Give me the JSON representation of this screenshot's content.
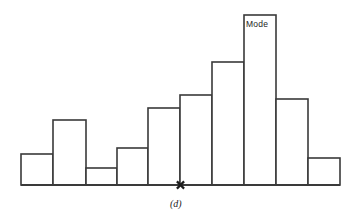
{
  "figure": {
    "caption": "(d)",
    "caption_x": 170,
    "caption_y": 199,
    "background_color": "#ffffff",
    "line_color": "#3a3a3a",
    "width": 358,
    "height": 217
  },
  "annotations": {
    "mode_label": "Mode",
    "mode_label_x": 246,
    "mode_label_y": 20,
    "x_marker_symbol": "x",
    "x_marker_position": 180.5
  },
  "chart_data": {
    "type": "bar",
    "title": "",
    "subtitle": "",
    "xlabel": "",
    "ylabel": "",
    "categories": [
      "1",
      "2",
      "3",
      "4",
      "5",
      "6",
      "7",
      "8",
      "9",
      "10"
    ],
    "values": [
      31,
      65,
      17,
      37,
      77,
      90,
      123,
      170,
      86,
      27
    ],
    "bar_edges": [
      21,
      53,
      86,
      117,
      148,
      180,
      212,
      244,
      276,
      308,
      340
    ],
    "bar_tops_px": [
      154,
      120,
      168,
      148,
      108,
      95,
      62,
      15,
      99,
      158
    ],
    "baseline_px": 185,
    "ylim": [
      0,
      185
    ],
    "grid": false,
    "legend": null,
    "annotations": [
      {
        "label": "Mode",
        "bar_index": 7
      },
      {
        "label": "x",
        "type": "marker",
        "x_px": 180.5
      }
    ]
  }
}
